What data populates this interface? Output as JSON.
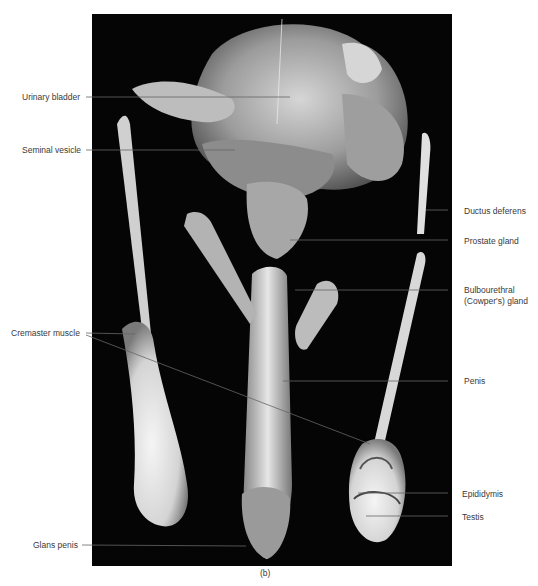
{
  "figure": {
    "caption": "(b)",
    "labels_left": [
      {
        "id": "urinary-bladder",
        "text": "Urinary bladder"
      },
      {
        "id": "seminal-vesicle",
        "text": "Seminal vesicle"
      },
      {
        "id": "cremaster-muscle",
        "text": "Cremaster muscle"
      },
      {
        "id": "glans-penis",
        "text": "Glans penis"
      }
    ],
    "labels_right": [
      {
        "id": "ductus-deferens",
        "text": "Ductus deferens"
      },
      {
        "id": "prostate-gland",
        "text": "Prostate gland"
      },
      {
        "id": "bulbourethral-gland-1",
        "text": "Bulbourethral"
      },
      {
        "id": "bulbourethral-gland-2",
        "text": "(Cowper's) gland"
      },
      {
        "id": "penis",
        "text": "Penis"
      },
      {
        "id": "epididymis",
        "text": "Epididymis"
      },
      {
        "id": "testis",
        "text": "Testis"
      }
    ]
  }
}
